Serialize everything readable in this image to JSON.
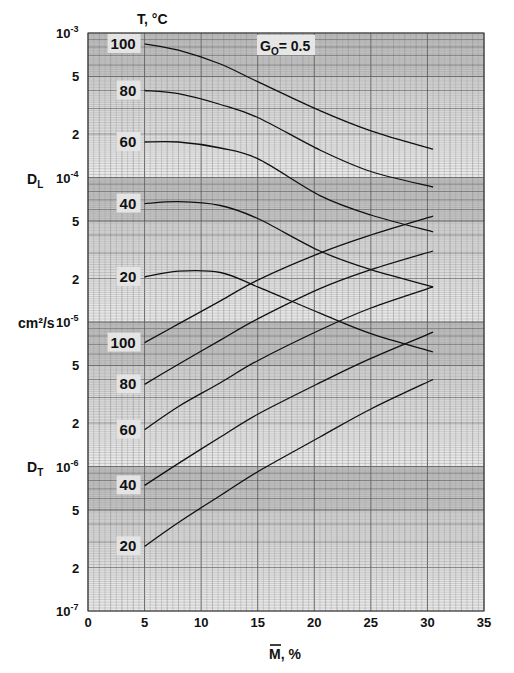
{
  "chart_data": {
    "type": "line",
    "title": "",
    "annotation": "G0 = 0.5",
    "annotation_parts": {
      "main": "G",
      "sub": "O",
      "rest": "= 0.5"
    },
    "legend_title": "T, °C",
    "xlabel": "M̄, %",
    "xlabel_main": "M",
    "xlabel_rest": ", %",
    "ylabel": "cm²/s",
    "ylabel_groups": [
      {
        "name": "D_L",
        "main": "D",
        "sub": "L"
      },
      {
        "name": "D_T",
        "main": "D",
        "sub": "T"
      }
    ],
    "xlim": [
      0,
      35
    ],
    "ylim": [
      1e-07,
      0.001
    ],
    "yscale": "log",
    "grid": true,
    "x_ticks": [
      "0",
      "5",
      "10",
      "15",
      "20",
      "25",
      "30",
      "35"
    ],
    "y_ticks": [
      {
        "value": 0.001,
        "base": "10",
        "exp": "-3"
      },
      {
        "value": 0.0005,
        "label": "5"
      },
      {
        "value": 0.0002,
        "label": "2"
      },
      {
        "value": 0.0001,
        "base": "10",
        "exp": "-4"
      },
      {
        "value": 5e-05,
        "label": "5"
      },
      {
        "value": 2e-05,
        "label": "2"
      },
      {
        "value": 1e-05,
        "base": "10",
        "exp": "-5"
      },
      {
        "value": 5e-06,
        "label": "5"
      },
      {
        "value": 2e-06,
        "label": "2"
      },
      {
        "value": 1e-06,
        "base": "10",
        "exp": "-6"
      },
      {
        "value": 5e-07,
        "label": "5"
      },
      {
        "value": 2e-07,
        "label": "2"
      },
      {
        "value": 1e-07,
        "base": "10",
        "exp": "-7"
      }
    ],
    "x": [
      5,
      8,
      11.7,
      15,
      20.5,
      25,
      30.5
    ],
    "series": [
      {
        "name": "D_L T=100°C",
        "group": "D_L",
        "label": "100",
        "values": [
          0.00084,
          0.00076,
          0.00061,
          0.00046,
          0.00029,
          0.00021,
          0.000157
        ]
      },
      {
        "name": "D_L T=80°C",
        "group": "D_L",
        "label": "80",
        "values": [
          0.0004,
          0.00038,
          0.00032,
          0.00026,
          0.000155,
          0.00011,
          8.6e-05
        ]
      },
      {
        "name": "D_L T=60°C",
        "group": "D_L",
        "label": "60",
        "values": [
          0.000176,
          0.000176,
          0.00016,
          0.000135,
          7.5e-05,
          5.5e-05,
          4.2e-05
        ]
      },
      {
        "name": "D_L T=40°C",
        "group": "D_L",
        "label": "40",
        "values": [
          6.6e-05,
          6.8e-05,
          6.4e-05,
          5.2e-05,
          3.1e-05,
          2.3e-05,
          1.75e-05
        ]
      },
      {
        "name": "D_L T=20°C",
        "group": "D_L",
        "label": "20",
        "values": [
          2.05e-05,
          2.25e-05,
          2.2e-05,
          1.75e-05,
          1.15e-05,
          8.3e-06,
          6.2e-06
        ]
      },
      {
        "name": "D_T T=100°C",
        "group": "D_T",
        "label": "100",
        "values": [
          7.2e-06,
          9.7e-06,
          1.4e-05,
          1.95e-05,
          3e-05,
          4e-05,
          5.4e-05
        ]
      },
      {
        "name": "D_T T=80°C",
        "group": "D_T",
        "label": "80",
        "values": [
          3.7e-06,
          5.1e-06,
          7.5e-06,
          1.05e-05,
          1.7e-05,
          2.3e-05,
          3.1e-05
        ]
      },
      {
        "name": "D_T T=60°C",
        "group": "D_T",
        "label": "60",
        "values": [
          1.8e-06,
          2.6e-06,
          3.8e-06,
          5.4e-06,
          8.8e-06,
          1.25e-05,
          1.75e-05
        ]
      },
      {
        "name": "D_T T=40°C",
        "group": "D_T",
        "label": "40",
        "values": [
          7.4e-07,
          1.05e-06,
          1.6e-06,
          2.3e-06,
          3.8e-06,
          5.6e-06,
          8.5e-06
        ]
      },
      {
        "name": "D_T T=20°C",
        "group": "D_T",
        "label": "20",
        "values": [
          2.8e-07,
          4.1e-07,
          6.3e-07,
          9.2e-07,
          1.6e-06,
          2.5e-06,
          4e-06
        ]
      }
    ]
  }
}
